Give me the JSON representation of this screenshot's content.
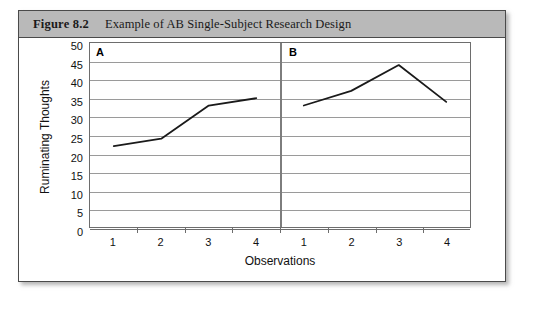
{
  "figure": {
    "number": "Figure 8.2",
    "title": "Example of AB Single-Subject Research Design"
  },
  "chart_data": {
    "type": "line",
    "title": "Example of AB Single-Subject Research Design",
    "xlabel": "Observations",
    "ylabel": "Ruminating Thoughts",
    "ylim": [
      0,
      50
    ],
    "ytick_labels": [
      "50",
      "45",
      "40",
      "35",
      "30",
      "25",
      "20",
      "15",
      "10",
      "5",
      "0"
    ],
    "yticks": [
      50,
      45,
      40,
      35,
      30,
      25,
      20,
      15,
      10,
      5,
      0
    ],
    "grid": true,
    "legend": "none",
    "phase_divider": true,
    "phases": [
      {
        "label": "A",
        "x": [
          1,
          2,
          3,
          4
        ],
        "xtick_labels": [
          "1",
          "2",
          "3",
          "4"
        ],
        "values": [
          22,
          24,
          33,
          35
        ]
      },
      {
        "label": "B",
        "x": [
          1,
          2,
          3,
          4
        ],
        "xtick_labels": [
          "1",
          "2",
          "3",
          "4"
        ],
        "values": [
          33,
          37,
          44,
          34
        ]
      }
    ],
    "line_color": "#1a1a1a",
    "grid_color": "#9a9a9a"
  },
  "colors": {
    "header_band": "#b9b9b9",
    "frame": "#4a4a4a",
    "text": "#111111"
  }
}
